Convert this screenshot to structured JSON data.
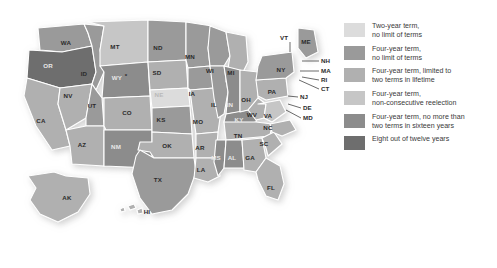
{
  "map": {
    "title": "United States gubernatorial term limits",
    "asterisk_note": "*",
    "background_color": "#ffffff",
    "border_color": "#ffffff",
    "states": [
      {
        "code": "WA",
        "category": 2,
        "label_x": 66,
        "label_y": 43
      },
      {
        "code": "OR",
        "category": 6,
        "label_x": 48,
        "label_y": 66
      },
      {
        "code": "CA",
        "category": 3,
        "label_x": 41,
        "label_y": 121
      },
      {
        "code": "NV",
        "category": 3,
        "label_x": 68,
        "label_y": 96
      },
      {
        "code": "ID",
        "category": 2,
        "label_x": 84,
        "label_y": 74
      },
      {
        "code": "MT",
        "category": 4,
        "label_x": 115,
        "label_y": 47
      },
      {
        "code": "WY",
        "category": 5,
        "label_x": 117,
        "label_y": 78
      },
      {
        "code": "UT",
        "category": 2,
        "label_x": 92,
        "label_y": 106
      },
      {
        "code": "AZ",
        "category": 3,
        "label_x": 82,
        "label_y": 145
      },
      {
        "code": "CO",
        "category": 3,
        "label_x": 127,
        "label_y": 113
      },
      {
        "code": "NM",
        "category": 5,
        "label_x": 116,
        "label_y": 147
      },
      {
        "code": "ND",
        "category": 2,
        "label_x": 158,
        "label_y": 48
      },
      {
        "code": "SD",
        "category": 3,
        "label_x": 157,
        "label_y": 73
      },
      {
        "code": "NE",
        "category": 1,
        "label_x": 159,
        "label_y": 95
      },
      {
        "code": "KS",
        "category": 2,
        "label_x": 161,
        "label_y": 120
      },
      {
        "code": "OK",
        "category": 3,
        "label_x": 167,
        "label_y": 146
      },
      {
        "code": "TX",
        "category": 2,
        "label_x": 158,
        "label_y": 180
      },
      {
        "code": "MN",
        "category": 2,
        "label_x": 190,
        "label_y": 57
      },
      {
        "code": "IA",
        "category": 2,
        "label_x": 192,
        "label_y": 94
      },
      {
        "code": "MO",
        "category": 3,
        "label_x": 198,
        "label_y": 122
      },
      {
        "code": "AR",
        "category": 3,
        "label_x": 200,
        "label_y": 148
      },
      {
        "code": "LA",
        "category": 3,
        "label_x": 201,
        "label_y": 170
      },
      {
        "code": "WI",
        "category": 2,
        "label_x": 210,
        "label_y": 71
      },
      {
        "code": "IL",
        "category": 2,
        "label_x": 214,
        "label_y": 105
      },
      {
        "code": "MS",
        "category": 5,
        "label_x": 216,
        "label_y": 158
      },
      {
        "code": "MI",
        "category": 3,
        "label_x": 231,
        "label_y": 73
      },
      {
        "code": "IN",
        "category": 5,
        "label_x": 230,
        "label_y": 105
      },
      {
        "code": "KY",
        "category": 5,
        "label_x": 239,
        "label_y": 120
      },
      {
        "code": "TN",
        "category": 3,
        "label_x": 238,
        "label_y": 136
      },
      {
        "code": "AL",
        "category": 5,
        "label_x": 232,
        "label_y": 158
      },
      {
        "code": "OH",
        "category": 3,
        "label_x": 246,
        "label_y": 100
      },
      {
        "code": "GA",
        "category": 3,
        "label_x": 250,
        "label_y": 158
      },
      {
        "code": "FL",
        "category": 3,
        "label_x": 271,
        "label_y": 188
      },
      {
        "code": "SC",
        "category": 3,
        "label_x": 264,
        "label_y": 144
      },
      {
        "code": "NC",
        "category": 3,
        "label_x": 268,
        "label_y": 128
      },
      {
        "code": "WV",
        "category": 3,
        "label_x": 252,
        "label_y": 115
      },
      {
        "code": "VA",
        "category": 4,
        "label_x": 268,
        "label_y": 116
      },
      {
        "code": "PA",
        "category": 3,
        "label_x": 272,
        "label_y": 92
      },
      {
        "code": "NY",
        "category": 2,
        "label_x": 281,
        "label_y": 70
      },
      {
        "code": "ME",
        "category": 2,
        "label_x": 306,
        "label_y": 42
      },
      {
        "code": "AK",
        "category": 3,
        "label_x": 67,
        "label_y": 198
      },
      {
        "code": "HI",
        "category": 3,
        "label_x": 147,
        "label_y": 212
      }
    ],
    "callouts": [
      {
        "code": "VT",
        "category": 1,
        "text_x": 288,
        "text_y": 38,
        "align": "end",
        "line": [
          [
            290,
            42
          ],
          [
            290,
            52
          ]
        ]
      },
      {
        "code": "NH",
        "category": 2,
        "text_x": 321,
        "text_y": 61,
        "align": "start",
        "line": [
          [
            319,
            61
          ],
          [
            302,
            61
          ]
        ]
      },
      {
        "code": "MA",
        "category": 2,
        "text_x": 321,
        "text_y": 71,
        "align": "start",
        "line": [
          [
            319,
            71
          ],
          [
            300,
            71
          ]
        ]
      },
      {
        "code": "RI",
        "category": 2,
        "text_x": 321,
        "text_y": 80,
        "align": "start",
        "line": [
          [
            319,
            80
          ],
          [
            302,
            77
          ]
        ]
      },
      {
        "code": "CT",
        "category": 2,
        "text_x": 321,
        "text_y": 89,
        "align": "start",
        "line": [
          [
            319,
            89
          ],
          [
            299,
            80
          ]
        ]
      },
      {
        "code": "NJ",
        "category": 5,
        "text_x": 300,
        "text_y": 97,
        "align": "start",
        "line": [
          [
            298,
            97
          ],
          [
            288,
            96
          ]
        ]
      },
      {
        "code": "DE",
        "category": 2,
        "text_x": 303,
        "text_y": 108,
        "align": "start",
        "line": [
          [
            301,
            108
          ],
          [
            288,
            104
          ]
        ]
      },
      {
        "code": "MD",
        "category": 3,
        "text_x": 303,
        "text_y": 118,
        "align": "start",
        "line": [
          [
            301,
            118
          ],
          [
            286,
            110
          ]
        ]
      }
    ]
  },
  "legend": {
    "items": [
      {
        "id": "two-year-no-limit",
        "color": "#dcdcdc",
        "lines": [
          "Two-year term,",
          "no limit of terms"
        ]
      },
      {
        "id": "four-year-no-limit",
        "color": "#9a9a9a",
        "lines": [
          "Four-year term,",
          "no limit of terms"
        ]
      },
      {
        "id": "four-year-two-lifetime",
        "color": "#b0b0b0",
        "lines": [
          "Four-year term, limited to",
          "two terms in lifetime"
        ]
      },
      {
        "id": "four-year-non-consecutive",
        "color": "#c6c6c6",
        "lines": [
          "Four-year term,",
          "non-consecutive reelection"
        ]
      },
      {
        "id": "four-year-two-in-sixteen",
        "color": "#8c8c8c",
        "lines": [
          "Four-year term, no more than",
          "two terms in sixteen years"
        ]
      },
      {
        "id": "eight-of-twelve",
        "color": "#6e6e6e",
        "lines": [
          "Eight out of twelve years"
        ]
      }
    ]
  },
  "category_colors": {
    "1": "#dcdcdc",
    "2": "#9a9a9a",
    "3": "#b0b0b0",
    "4": "#c6c6c6",
    "5": "#8c8c8c",
    "6": "#6e6e6e"
  }
}
